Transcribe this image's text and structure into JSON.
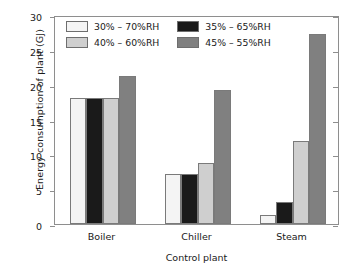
{
  "chart_data": {
    "type": "bar",
    "title": "",
    "xlabel": "Control plant",
    "ylabel": "Energy consumption of plant (GJ)",
    "categories": [
      "Boiler",
      "Chiller",
      "Steam"
    ],
    "series": [
      {
        "name": "30% – 70%RH",
        "values": [
          18.1,
          7.2,
          1.3
        ],
        "color": "#f4f4f4"
      },
      {
        "name": "35% – 65%RH",
        "values": [
          18.1,
          7.2,
          3.2
        ],
        "color": "#1a1a1a"
      },
      {
        "name": "40% – 60%RH",
        "values": [
          18.1,
          8.8,
          11.9
        ],
        "color": "#cfcfcf"
      },
      {
        "name": "45% – 55%RH",
        "values": [
          21.2,
          19.2,
          27.3
        ],
        "color": "#808080"
      }
    ],
    "ylim": [
      0,
      30
    ],
    "yticks": [
      0,
      5,
      10,
      15,
      20,
      25,
      30
    ],
    "ytick_labels": [
      "0",
      "5",
      "10",
      "15",
      "20",
      "25",
      "30"
    ],
    "grid": false,
    "legend_position": "upper-left-inside",
    "axis_color": "#8e8e8e",
    "bar_border_color": "#7a7a7a",
    "text_color": "#1a1a1a"
  }
}
